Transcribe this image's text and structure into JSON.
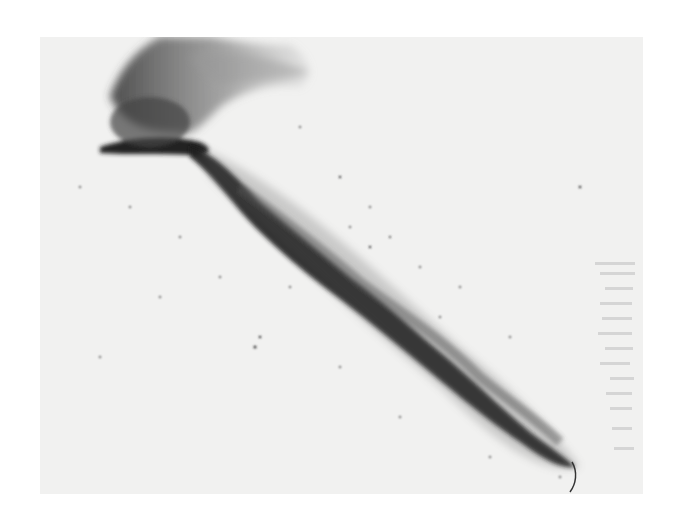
{
  "image": {
    "subject": "gunpowder-style ink drawing on paper",
    "description": "diagonal dark burst streak from upper left to lower right with smoky plume at top-left and faint calligraphy at right edge",
    "colors": {
      "background": "#ffffff",
      "paper": "#f1f1f0",
      "ink_dark": "#1e1e1e",
      "ink_mid": "#555555",
      "smoke": "#8a8a8a"
    }
  }
}
